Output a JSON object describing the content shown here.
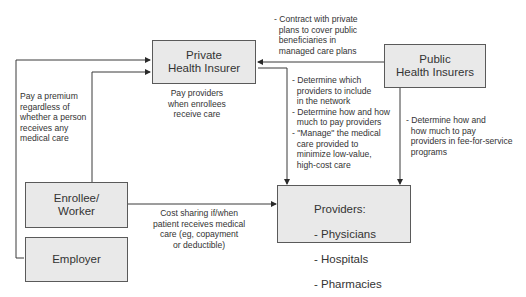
{
  "diagram": {
    "nodes": {
      "private_insurer": "Private\nHealth Insurer",
      "public_insurers": "Public\nHealth Insurers",
      "enrollee": "Enrollee/\nWorker",
      "employer": "Employer",
      "providers_title": "Providers:",
      "providers_items": [
        "- Physicians",
        "- Hospitals",
        "- Pharmacies"
      ]
    },
    "edge_labels": {
      "premium": "Pay a premium\nregardless of\nwhether a person\nreceives any\nmedical care",
      "pay_providers": "Pay providers\nwhen enrollees\nreceive care",
      "contract": "- Contract with private\n  plans to cover public\n  beneficiaries in\n  managed care plans",
      "private_to_providers": "- Determine which\n  providers to include\n  in the network\n- Determine how and how\n  much to pay providers\n- \"Manage\" the medical\n  care provided to\n  minimize low-value,\n  high-cost care",
      "public_to_providers": "- Determine how and\n  how much to pay\n  providers in fee-for-service\n  programs",
      "cost_sharing": "Cost sharing if/when\npatient receives medical\ncare (eg, copayment\nor deductible)"
    },
    "colors": {
      "box_fill": "#e9e9e9",
      "box_border": "#5a5a5a",
      "line": "#3a3a3a"
    }
  }
}
